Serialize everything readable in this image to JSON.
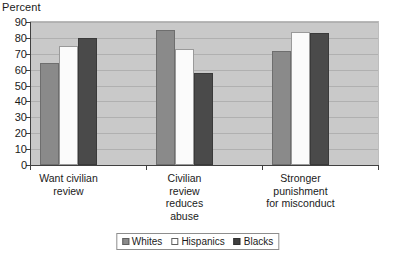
{
  "chart_data": {
    "type": "bar",
    "title": "",
    "xlabel": "",
    "ylabel": "Percent",
    "ylim": [
      0,
      90
    ],
    "ytick_step": 10,
    "yticks": [
      0,
      10,
      20,
      30,
      40,
      50,
      60,
      70,
      80,
      90
    ],
    "grid": true,
    "legend_position": "bottom",
    "categories": [
      "Want civilian\nreview",
      "Civilian\nreview\nreduces\nabuse",
      "Stronger\npunishment\nfor misconduct"
    ],
    "series": [
      {
        "name": "Whites",
        "color": "#8a8a8a",
        "values": [
          64,
          85,
          72
        ]
      },
      {
        "name": "Hispanics",
        "color": "#fbfbfb",
        "values": [
          75,
          73,
          84
        ]
      },
      {
        "name": "Blacks",
        "color": "#4a4a4a",
        "values": [
          80,
          58,
          83
        ]
      }
    ],
    "plot_background": "#c9c9c9",
    "axis_color": "#404040"
  }
}
